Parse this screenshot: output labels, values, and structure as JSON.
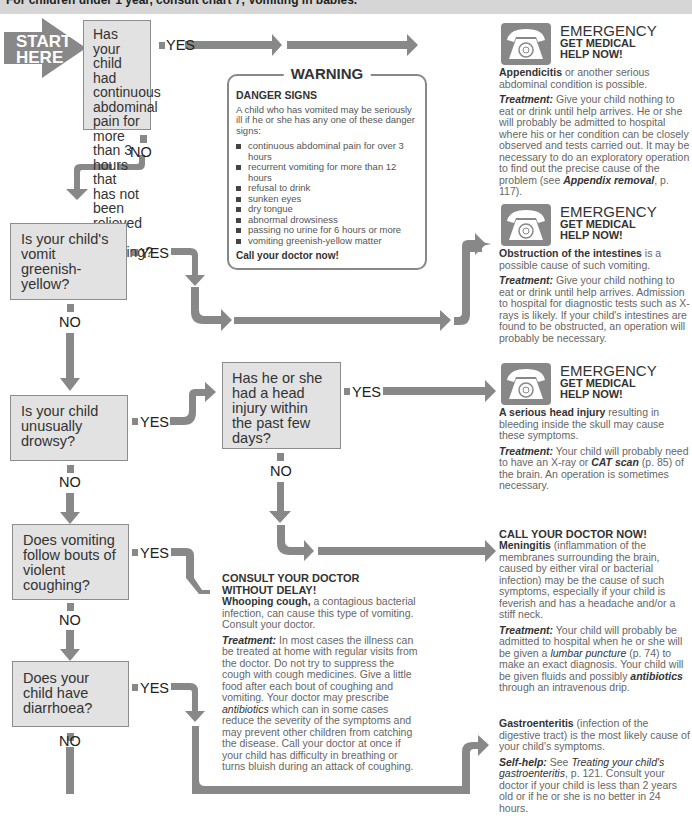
{
  "header": {
    "note": "For children under 1 year, consult chart 7, Vomiting in babies."
  },
  "start": {
    "line1": "START",
    "line2": "HERE"
  },
  "labels": {
    "yes": "YES",
    "no": "NO"
  },
  "questions": [
    {
      "id": "q1",
      "text": "Has your child had continuous abdominal pain for more than 3 hours that has not been relieved by vomiting?"
    },
    {
      "id": "q2",
      "text": "Is your child's vomit greenish-yellow?"
    },
    {
      "id": "q3",
      "text": "Is your child unusually drowsy?"
    },
    {
      "id": "q4",
      "text": "Has he or she had a head injury within the past few days?"
    },
    {
      "id": "q5",
      "text": "Does vomiting follow bouts of violent coughing?"
    },
    {
      "id": "q6",
      "text": "Does your child have diarrhoea?"
    }
  ],
  "warning": {
    "title": "WARNING",
    "heading": "DANGER SIGNS",
    "intro": "A child who has vomited may be seriously ill if he or she has any one of these danger signs:",
    "signs": [
      "continuous abdominal pain for over 3 hours",
      "recurrent vomiting for more than 12 hours",
      "refusal to drink",
      "sunken eyes",
      "dry tongue",
      "abnormal drowsiness",
      "passing no urine for 6 hours or more",
      "vomiting greenish-yellow matter"
    ],
    "call": "Call your doctor now!"
  },
  "emergency": {
    "title": "EMERGENCY",
    "sub1": "GET MEDICAL",
    "sub2": "HELP NOW!",
    "icon": "telephone-icon"
  },
  "results": {
    "appendicitis": {
      "bold": "Appendicitis",
      "text": " or another serious abdominal condition is possible.",
      "treat_label": "Treatment:",
      "treat": " Give your child nothing to eat or drink until help arrives. He or she will probably be admitted to hospital where his or her condition can be closely observed and tests carried out. It may be necessary to do an exploratory operation to find out the precise cause of the problem (see ",
      "ref": "Appendix removal",
      "ref_tail": ", p. 117)."
    },
    "obstruction": {
      "bold": "Obstruction of the intestines",
      "text": " is a possible cause of such vomiting.",
      "treat_label": "Treatment:",
      "treat": " Give your child nothing to eat or drink until help arrives. Admission to hospital for diagnostic tests such as X-rays is likely. If your child's intestines are found to be obstructed, an operation will probably be necessary."
    },
    "head_injury": {
      "bold": "A serious head injury",
      "text": " resulting in bleeding inside the skull may cause these symptoms.",
      "treat_label": "Treatment:",
      "treat": " Your child will probably need to have an X-ray or ",
      "ref": "CAT scan",
      "ref_tail": " (p. 85) of the brain. An operation is sometimes necessary."
    },
    "meningitis": {
      "heading": "CALL YOUR DOCTOR NOW!",
      "bold": "Meningitis",
      "text": " (inflammation of the membranes surrounding the brain, caused by either viral or bacterial infection) may be the cause of such symptoms, especially if your child is feverish and has a headache and/or a stiff neck.",
      "treat_label": "Treatment:",
      "treat": " Your child will probably be admitted to hospital when he or she will be given a ",
      "ref": "lumbar puncture",
      "ref_tail": " (p. 74) to make an exact diagnosis. Your child will be given fluids and possibly ",
      "ref2": "antibiotics",
      "ref2_tail": " through an intravenous drip."
    },
    "whooping": {
      "heading1": "CONSULT YOUR DOCTOR",
      "heading2": "WITHOUT DELAY!",
      "bold": "Whooping cough,",
      "text": " a contagious bacterial infection, can cause this type of vomiting. Consult your doctor.",
      "treat_label": "Treatment:",
      "treat": " In most cases the illness can be treated at home with regular visits from the doctor. Do not try to suppress the cough with cough medicines. Give a little food after each bout of coughing and vomiting. Your doctor may prescribe ",
      "ref": "antibiotics",
      "ref_tail": " which can in some cases reduce the severity of the symptoms and may prevent other children from catching the disease. Call your doctor at once if your child has difficulty in breathing or turns bluish during an attack of coughing."
    },
    "gastro": {
      "bold": "Gastroenteritis",
      "text": " (infection of the digestive tract) is the most likely cause of your child's symptoms.",
      "treat_label": "Self-help:",
      "treat": " See ",
      "ref": "Treating your child's gastroenteritis",
      "ref_tail": ", p. 121. Consult your doctor if your child is less than 2 years old or if he or she is no better in 24 hours."
    }
  },
  "colors": {
    "arrow": "#888888",
    "box": "#e2e2e2",
    "box_border": "#8d8d8d",
    "header_bar": "#d6d6d6"
  }
}
